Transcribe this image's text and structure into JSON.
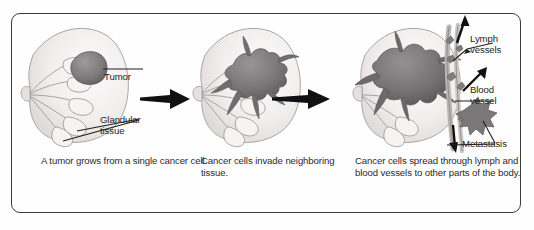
{
  "figure": {
    "border_color": "#3b3b3f",
    "background_color": "#fefefe",
    "ink_color": "#231f20",
    "tissue_fill": "#f0eeec",
    "tumor_fill": "#7d7b7c",
    "vessel_fill": "#cfcdcb"
  },
  "panels": [
    {
      "id": "panel-1",
      "stage": "1",
      "caption": "A tumor grows from a\nsingle cancer cell.",
      "labels": [
        {
          "name": "tumor",
          "text": "Tumor"
        },
        {
          "name": "glandular-tissue",
          "text": "Glandular\ntissue"
        }
      ]
    },
    {
      "id": "panel-2",
      "stage": "2",
      "caption": "Cancer cells invade\nneighboring tissue.",
      "labels": []
    },
    {
      "id": "panel-3",
      "stage": "3",
      "caption": "Cancer cells spread through\nlymph and blood vessels to\nother parts of the body.",
      "labels": [
        {
          "name": "lymph-vessels",
          "text": "Lymph\nvessels"
        },
        {
          "name": "blood-vessel",
          "text": "Blood\nvessel"
        },
        {
          "name": "metastasis",
          "text": "Metastasis"
        }
      ]
    }
  ],
  "arrows": [
    {
      "name": "progression-arrow-1",
      "direction": "right"
    },
    {
      "name": "progression-arrow-2",
      "direction": "right"
    }
  ]
}
